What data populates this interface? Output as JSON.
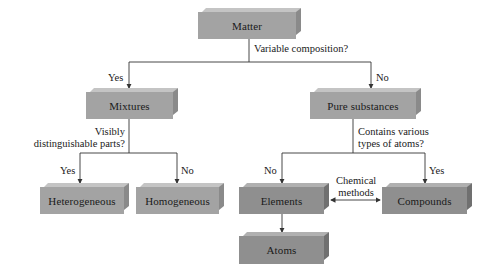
{
  "diagram": {
    "nodes": {
      "matter": "Matter",
      "mixtures": "Mixtures",
      "pure_substances": "Pure substances",
      "heterogeneous": "Heterogeneous",
      "homogeneous": "Homogeneous",
      "elements": "Elements",
      "compounds": "Compounds",
      "atoms": "Atoms"
    },
    "questions": {
      "q1": "Variable composition?",
      "q2_line1": "Visibly",
      "q2_line2": "distinguishable parts?",
      "q3_line1": "Contains various",
      "q3_line2": "types of atoms?"
    },
    "edge_labels": {
      "matter_mixtures": "Yes",
      "matter_pure": "No",
      "mixtures_hetero": "Yes",
      "mixtures_homo": "No",
      "pure_elements": "No",
      "pure_compounds": "Yes",
      "elements_compounds_line1": "Chemical",
      "elements_compounds_line2": "methods"
    },
    "colors": {
      "box_light": "#a3a3a3",
      "box_dark": "#8f8f8f",
      "line": "#333333"
    }
  }
}
